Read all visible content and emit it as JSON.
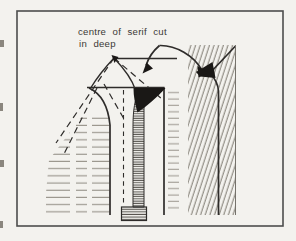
{
  "annotation": {
    "line1": "centre of serif cut",
    "line2": "in deep"
  },
  "colors": {
    "paper": "#f3f2ee",
    "frame": "#4d4d4d",
    "ink": "#2e2c2a",
    "ink_light": "#75726b",
    "hatch_light": "#98948b",
    "hatch_mid": "#8b877e",
    "hatch_dark": "#514e49",
    "fill_black": "#1a1816",
    "label": "#3b3935"
  }
}
